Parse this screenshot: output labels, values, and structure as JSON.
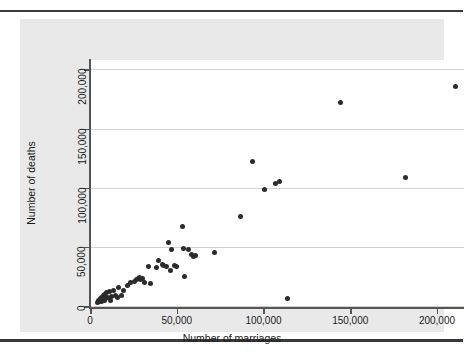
{
  "figure": {
    "background_color": "#e9e9e9",
    "plot_background_color": "#ffffff",
    "marker_color": "#2b2b2b",
    "grid_color": "#d2d2d2",
    "axis_color": "#555555",
    "rule_color": "#3a3a3a"
  },
  "chart_data": {
    "type": "scatter",
    "title": "",
    "xlabel": "Number of marriages",
    "ylabel": "Number of deaths",
    "xlim": [
      0,
      215000
    ],
    "ylim": [
      0,
      208000
    ],
    "xticks": [
      0,
      50000,
      100000,
      150000,
      200000
    ],
    "xticklabels": [
      "0",
      "50,000",
      "100,000",
      "150,000",
      "200,000"
    ],
    "yticks": [
      0,
      50000,
      100000,
      150000,
      200000
    ],
    "yticklabels": [
      "0",
      "50,000",
      "100,000",
      "150,000",
      "200,000"
    ],
    "grid": "horizontal",
    "legend": "none",
    "marker": "filled-circle",
    "points": [
      [
        4000,
        3000
      ],
      [
        4500,
        5000
      ],
      [
        5000,
        4000
      ],
      [
        5500,
        6500
      ],
      [
        6000,
        3500
      ],
      [
        6200,
        7500
      ],
      [
        6800,
        5500
      ],
      [
        7000,
        8500
      ],
      [
        7500,
        4500
      ],
      [
        8000,
        9500
      ],
      [
        8500,
        6000
      ],
      [
        9000,
        11000
      ],
      [
        9500,
        7000
      ],
      [
        10500,
        12500
      ],
      [
        11000,
        5000
      ],
      [
        12000,
        8000
      ],
      [
        13000,
        13500
      ],
      [
        14000,
        9000
      ],
      [
        15000,
        7500
      ],
      [
        16000,
        15500
      ],
      [
        17500,
        8500
      ],
      [
        19000,
        13500
      ],
      [
        21000,
        17000
      ],
      [
        23000,
        19500
      ],
      [
        25000,
        20500
      ],
      [
        26500,
        22000
      ],
      [
        27500,
        23500
      ],
      [
        28000,
        24000
      ],
      [
        28500,
        22500
      ],
      [
        29500,
        23000
      ],
      [
        31000,
        20000
      ],
      [
        33000,
        33000
      ],
      [
        34500,
        19000
      ],
      [
        38000,
        32500
      ],
      [
        39000,
        38500
      ],
      [
        41000,
        35000
      ],
      [
        42000,
        34000
      ],
      [
        43500,
        33000
      ],
      [
        44500,
        54000
      ],
      [
        46000,
        30000
      ],
      [
        46500,
        48000
      ],
      [
        48000,
        34000
      ],
      [
        49500,
        33500
      ],
      [
        53000,
        67500
      ],
      [
        53500,
        49000
      ],
      [
        54000,
        25000
      ],
      [
        56000,
        48000
      ],
      [
        58000,
        43500
      ],
      [
        59000,
        42000
      ],
      [
        60000,
        43000
      ],
      [
        71000,
        45000
      ],
      [
        86000,
        75500
      ],
      [
        93000,
        122000
      ],
      [
        100000,
        98500
      ],
      [
        106500,
        104000
      ],
      [
        108500,
        105000
      ],
      [
        113000,
        6500
      ],
      [
        144000,
        172000
      ],
      [
        181000,
        108500
      ],
      [
        210000,
        186000
      ]
    ]
  }
}
